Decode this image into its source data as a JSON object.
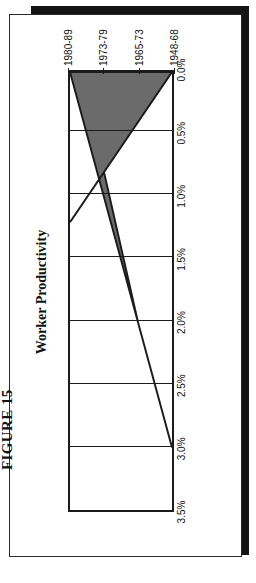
{
  "figure": {
    "caption": "FIGURE 15"
  },
  "chart_data": {
    "type": "area",
    "title": "Worker Productivity",
    "orientation": "horizontal",
    "categories": [
      "1948-68",
      "1965-73",
      "1973-79",
      "1980-89"
    ],
    "values": [
      3.0,
      2.0,
      0.8,
      1.2
    ],
    "xlabel": "",
    "ylabel": "",
    "ylim": [
      0.0,
      3.5
    ],
    "ytick_labels": [
      "3.5%",
      "3.0%",
      "2.5%",
      "2.0%",
      "1.5%",
      "1.0%",
      "0.5%",
      "0.0%"
    ],
    "ytick_values": [
      3.5,
      3.0,
      2.5,
      2.0,
      1.5,
      1.0,
      0.5,
      0.0
    ],
    "grid": true,
    "legend": "none",
    "series_name": "Worker Productivity",
    "fill_color": "#6b6b6b",
    "line_color": "#1b1b1b",
    "axis_color": "#1b1b1b",
    "background": "#ffffff"
  }
}
